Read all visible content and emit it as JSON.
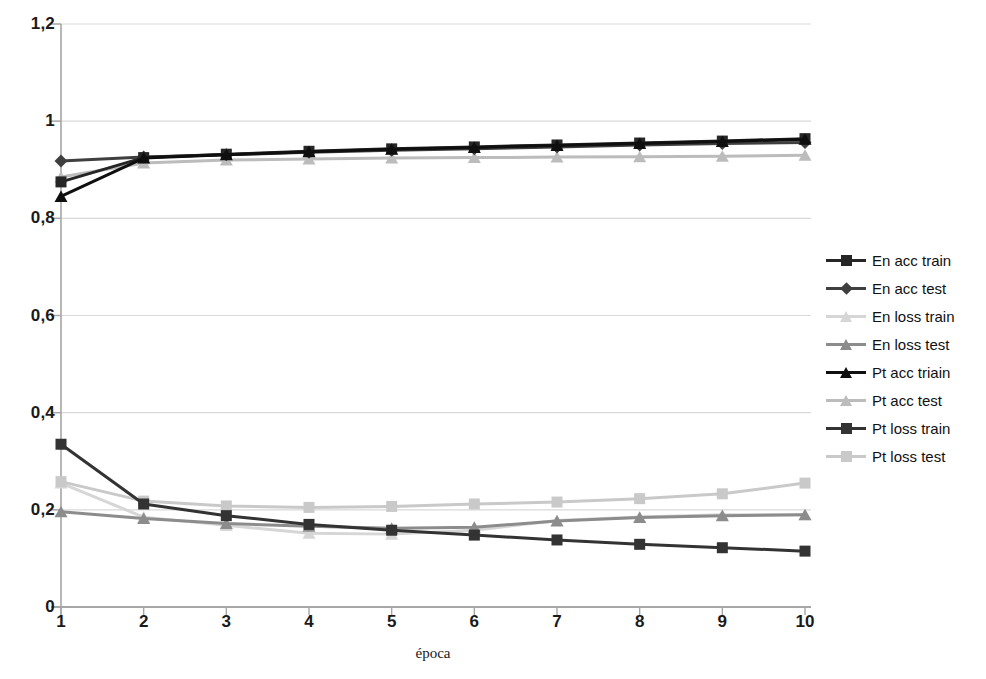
{
  "chart_data": {
    "type": "line",
    "title": "",
    "xlabel": "época",
    "ylabel": "",
    "x": [
      1,
      2,
      3,
      4,
      5,
      6,
      7,
      8,
      9,
      10
    ],
    "xtick_labels": [
      "1",
      "2",
      "3",
      "4",
      "5",
      "6",
      "7",
      "8",
      "9",
      "10"
    ],
    "ytick_labels": [
      "0",
      "0,2",
      "0,4",
      "0,6",
      "0,8",
      "1",
      "1,2"
    ],
    "ytick_values": [
      0,
      0.2,
      0.4,
      0.6,
      0.8,
      1,
      1.2
    ],
    "ylim": [
      0,
      1.2
    ],
    "xlim": [
      1,
      10
    ],
    "grid": "horizontal",
    "legend_position": "right",
    "series": [
      {
        "name": "En acc train",
        "marker": "square",
        "color": "#262626",
        "values": [
          0.875,
          0.925,
          0.932,
          0.938,
          0.943,
          0.947,
          0.951,
          0.955,
          0.959,
          0.964
        ]
      },
      {
        "name": "En acc test",
        "marker": "diamond",
        "color": "#3f3f3f",
        "values": [
          0.918,
          0.926,
          0.931,
          0.936,
          0.94,
          0.943,
          0.947,
          0.951,
          0.954,
          0.956
        ]
      },
      {
        "name": "En loss train",
        "marker": "triangle",
        "color": "#d6d6d6",
        "values": [
          0.255,
          0.185,
          0.168,
          0.152,
          0.15,
          0.158,
          0.178,
          0.185,
          0.19,
          0.19
        ]
      },
      {
        "name": "En loss test",
        "marker": "triangle",
        "color": "#8c8c8c",
        "values": [
          0.196,
          0.182,
          0.172,
          0.166,
          0.162,
          0.164,
          0.177,
          0.184,
          0.188,
          0.19
        ]
      },
      {
        "name": "Pt acc triain",
        "marker": "triangle",
        "color": "#0f0f0f",
        "values": [
          0.845,
          0.924,
          0.931,
          0.937,
          0.942,
          0.946,
          0.95,
          0.954,
          0.958,
          0.963
        ]
      },
      {
        "name": "Pt acc test",
        "marker": "triangle",
        "color": "#bcbcbc",
        "values": [
          0.885,
          0.914,
          0.92,
          0.922,
          0.924,
          0.925,
          0.926,
          0.927,
          0.928,
          0.93
        ]
      },
      {
        "name": "Pt loss train",
        "marker": "square",
        "color": "#333333",
        "values": [
          0.335,
          0.212,
          0.188,
          0.17,
          0.158,
          0.148,
          0.138,
          0.129,
          0.122,
          0.115
        ]
      },
      {
        "name": "Pt loss test",
        "marker": "square",
        "color": "#c9c9c9",
        "values": [
          0.258,
          0.218,
          0.208,
          0.205,
          0.207,
          0.212,
          0.216,
          0.223,
          0.233,
          0.255
        ]
      }
    ]
  },
  "plot": {
    "background": "#ffffff",
    "grid_color": "#d9d9d9",
    "axis_color": "#a6a6a6"
  }
}
